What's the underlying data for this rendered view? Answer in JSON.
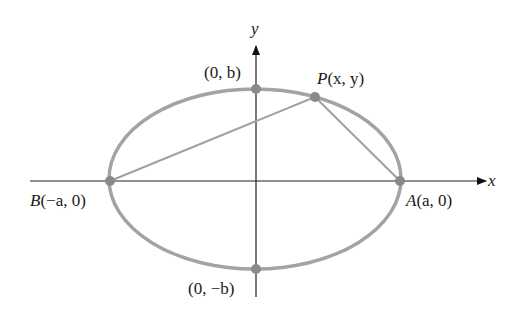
{
  "diagram": {
    "type": "ellipse-coordinate-diagram",
    "axes": {
      "x_label": "x",
      "y_label": "y"
    },
    "points": {
      "A": {
        "name": "A",
        "coords": "(a, 0)",
        "x": 400,
        "y": 181
      },
      "B": {
        "name": "B",
        "coords": "(−a, 0)",
        "x": 110,
        "y": 181
      },
      "P": {
        "name": "P",
        "coords": "(x, y)",
        "x": 315,
        "y": 97
      },
      "top": {
        "coords": "(0, b)",
        "x": 256,
        "y": 89
      },
      "bottom": {
        "coords": "(0, −b)",
        "x": 256,
        "y": 269
      }
    },
    "segments": [
      "B-P",
      "P-A"
    ],
    "colors": {
      "ellipse": "#9e9e9e",
      "point": "#8a8a8a",
      "axis": "#222222",
      "segment": "#a0a0a0"
    }
  }
}
